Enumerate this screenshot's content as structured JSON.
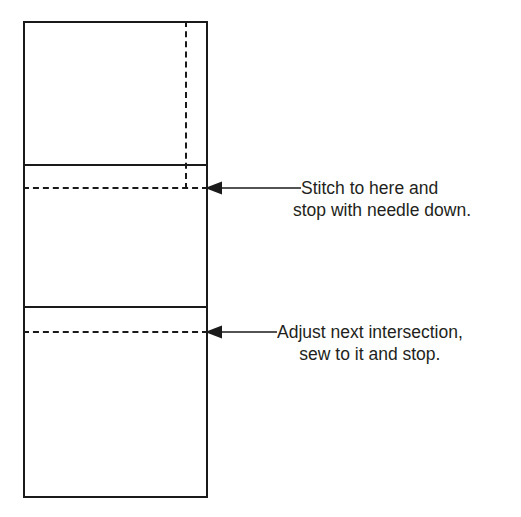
{
  "diagram": {
    "background_color": "#ffffff",
    "line_color": "#1a1a1a",
    "text_color": "#231f20",
    "panel": {
      "name": "fabric-panel",
      "x": 23,
      "y": 21,
      "width": 185,
      "height": 477
    },
    "seam_lines": [
      {
        "name": "seam-line-upper",
        "y": 164
      },
      {
        "name": "seam-line-lower",
        "y": 306
      }
    ],
    "stitch_lines": [
      {
        "name": "stitch-line-upper",
        "y": 187,
        "style": "dashed"
      },
      {
        "name": "stitch-line-lower",
        "y": 331,
        "style": "dashed"
      }
    ],
    "alignment_line": {
      "name": "vertical-alignment-line",
      "x": 185,
      "y_start": 21,
      "y_end": 189,
      "style": "dashed"
    }
  },
  "callouts": [
    {
      "arrow_icon": "arrow-left-icon",
      "line_1": "Stitch to here and",
      "line_2": "stop with needle down."
    },
    {
      "arrow_icon": "arrow-left-icon",
      "line_1": "Adjust next intersection,",
      "line_2": "sew to it and stop."
    }
  ]
}
